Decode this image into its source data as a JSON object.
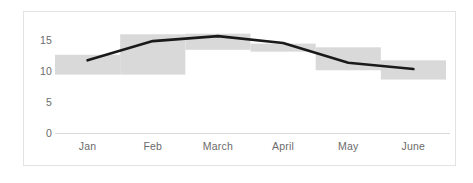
{
  "chart_data": {
    "type": "bar",
    "title": "",
    "xlabel": "",
    "ylabel": "",
    "categories": [
      "Jan",
      "Feb",
      "March",
      "April",
      "May",
      "June"
    ],
    "yticks": [
      "0",
      "5",
      "10",
      "15"
    ],
    "ytick_values": [
      0,
      5,
      10,
      15
    ],
    "ylim": [
      0,
      16.5
    ],
    "grid": false,
    "legend": null,
    "series": [
      {
        "name": "Range",
        "type": "bar",
        "style": "floating-range-bars",
        "color": "#d9d9d9",
        "low": [
          9.5,
          9.5,
          13.5,
          13.2,
          10.2,
          8.7
        ],
        "high": [
          12.7,
          16.0,
          16.1,
          14.5,
          13.9,
          11.8
        ]
      },
      {
        "name": "Trend",
        "type": "line",
        "color": "#1a1a1a",
        "values": [
          11.8,
          14.9,
          15.7,
          14.6,
          11.4,
          10.4
        ]
      }
    ],
    "axis_color": "#d9d9d9",
    "tick_text_color": "#6b6b6b",
    "background": "#ffffff",
    "border_color": "#e3e3e3"
  }
}
